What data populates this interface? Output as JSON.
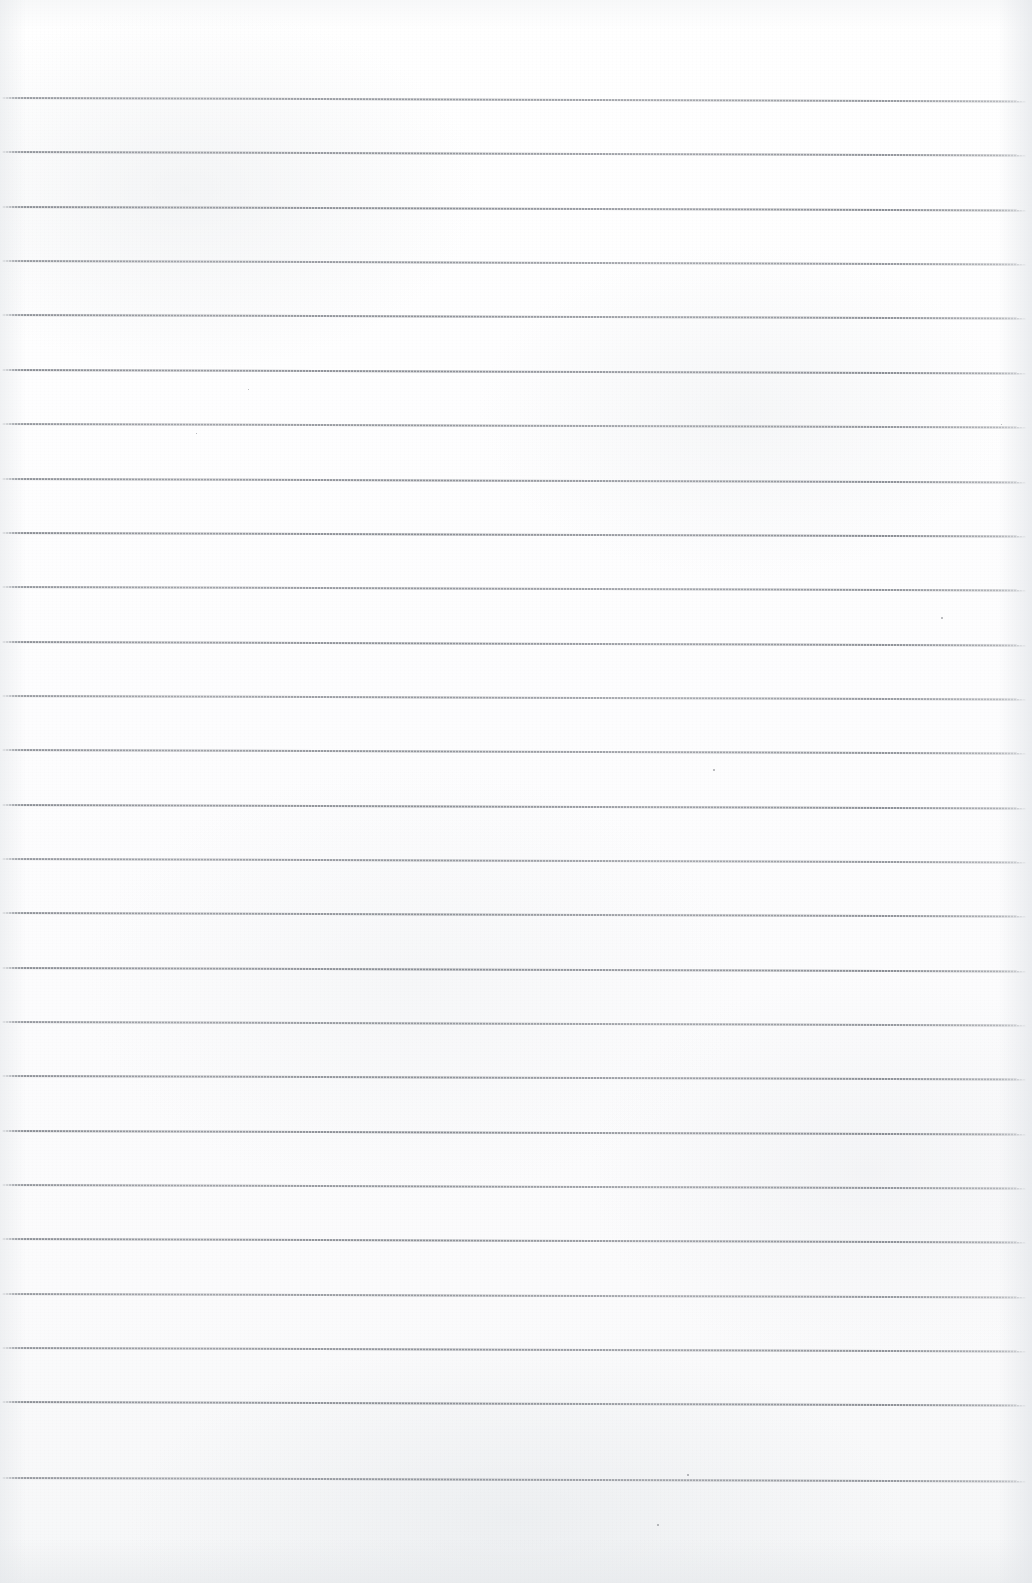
{
  "document": {
    "kind": "scanned-page",
    "title": "Blank Ruled Notebook Page",
    "description": "Scanned blank lined paper, no handwriting or printed text",
    "page_width": 1032,
    "page_height": 1583,
    "paper_color": "#fdfdfd",
    "rule_color": "#82868d",
    "text_content": "",
    "visible_text": []
  },
  "ruling": {
    "line_count": 26,
    "first_line_y": 97,
    "line_spacing": 54.35,
    "line_start_x": 2,
    "line_end_x": 1026,
    "line_thickness": 2,
    "tilt_px_across_page": 3.5,
    "lines_y": [
      97,
      151.4,
      205.7,
      260.1,
      314.4,
      368.8,
      423.1,
      477.5,
      531.8,
      586.2,
      640.5,
      694.9,
      749.2,
      803.6,
      857.9,
      912.3,
      966.6,
      1021.0,
      1075.3,
      1129.7,
      1184.0,
      1238.4,
      1292.7,
      1347.1,
      1401.4,
      1477.0
    ]
  },
  "artifacts": {
    "specks": [
      {
        "x": 713,
        "y": 769,
        "size": 2
      },
      {
        "x": 941,
        "y": 617,
        "size": 2
      },
      {
        "x": 657,
        "y": 1524,
        "size": 2
      },
      {
        "x": 687,
        "y": 1474,
        "size": 2
      },
      {
        "x": 248,
        "y": 389,
        "size": 1
      },
      {
        "x": 196,
        "y": 433,
        "size": 1
      },
      {
        "x": 1001,
        "y": 424,
        "size": 1
      }
    ]
  }
}
